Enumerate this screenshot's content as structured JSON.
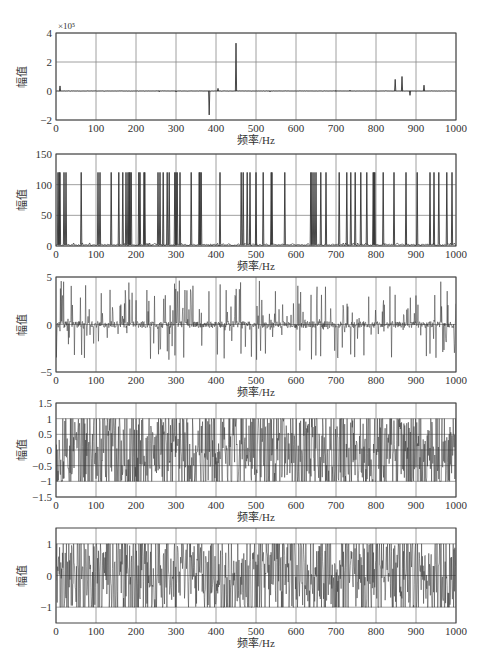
{
  "figure": {
    "width": 490,
    "height": 664,
    "colors": {
      "background": "#ffffff",
      "axes": "#444444",
      "grid": "#888888",
      "line": "#333333",
      "text": "#333333"
    }
  },
  "chart_data": [
    {
      "type": "line",
      "title": "",
      "xlabel": "频率/Hz",
      "ylabel": "幅值",
      "xlim": [
        0,
        1000
      ],
      "ylim": [
        -2,
        4
      ],
      "y_exponent_label": "×10⁵",
      "xticks": [
        0,
        100,
        200,
        300,
        400,
        500,
        600,
        700,
        800,
        900,
        1000
      ],
      "yticks": [
        -2,
        0,
        2,
        4
      ],
      "ytick_labels": [
        "−2",
        "0",
        "2",
        "4"
      ],
      "grid": true,
      "layout": {
        "top": 33,
        "bottom": 120,
        "left": 56,
        "right": 456,
        "show_xlabel": true
      },
      "signal": {
        "mode": "spikes",
        "baseline_noise": 0.02,
        "seed": 11
      },
      "spikes": [
        {
          "x": 10,
          "y": 0.35
        },
        {
          "x": 258,
          "y": -0.05
        },
        {
          "x": 300,
          "y": -0.06
        },
        {
          "x": 383,
          "y": -1.65
        },
        {
          "x": 405,
          "y": 0.18
        },
        {
          "x": 450,
          "y": 3.3
        },
        {
          "x": 535,
          "y": -0.05
        },
        {
          "x": 700,
          "y": 0.04
        },
        {
          "x": 735,
          "y": 0.05
        },
        {
          "x": 848,
          "y": 0.8
        },
        {
          "x": 865,
          "y": 1.0
        },
        {
          "x": 885,
          "y": -0.3
        },
        {
          "x": 920,
          "y": 0.4
        }
      ]
    },
    {
      "type": "line",
      "title": "",
      "xlabel": "频率/Hz",
      "ylabel": "幅值",
      "xlim": [
        0,
        1000
      ],
      "ylim": [
        0,
        150
      ],
      "xticks": [
        0,
        100,
        200,
        300,
        400,
        500,
        600,
        700,
        800,
        900,
        1000
      ],
      "yticks": [
        0,
        50,
        100,
        150
      ],
      "ytick_labels": [
        "0",
        "50",
        "100",
        "150"
      ],
      "grid": true,
      "layout": {
        "top": 154,
        "bottom": 246,
        "left": 56,
        "right": 456,
        "show_xlabel": true
      },
      "signal": {
        "mode": "spikes",
        "baseline": 2,
        "baseline_noise": 3,
        "seed": 23
      },
      "spike_height": 120,
      "spike_positions": [
        5,
        8,
        10,
        20,
        25,
        63,
        105,
        110,
        138,
        157,
        167,
        175,
        180,
        183,
        185,
        188,
        207,
        210,
        220,
        222,
        255,
        260,
        268,
        278,
        283,
        297,
        300,
        303,
        310,
        338,
        358,
        360,
        363,
        410,
        463,
        468,
        478,
        485,
        500,
        518,
        538,
        540,
        572,
        637,
        640,
        645,
        650,
        662,
        675,
        708,
        727,
        737,
        748,
        762,
        777,
        793,
        795,
        797,
        818,
        845,
        875,
        903,
        935,
        945,
        957,
        977,
        990
      ]
    },
    {
      "type": "line",
      "title": "",
      "xlabel": "频率/Hz",
      "ylabel": "幅值",
      "xlim": [
        0,
        1000
      ],
      "ylim": [
        -5,
        5
      ],
      "xticks": [
        0,
        100,
        200,
        300,
        400,
        500,
        600,
        700,
        800,
        900,
        1000
      ],
      "yticks": [
        -5,
        0,
        5
      ],
      "ytick_labels": [
        "−5",
        "0",
        "5"
      ],
      "grid": true,
      "layout": {
        "top": 277,
        "bottom": 372,
        "left": 56,
        "right": 456,
        "show_xlabel": true
      },
      "signal": {
        "mode": "sparse-noise",
        "points": 1000,
        "amplitude": 4.2,
        "density": 0.22,
        "small": 0.35,
        "seed": 37
      }
    },
    {
      "type": "line",
      "title": "",
      "xlabel": "频率/Hz",
      "ylabel": "幅值",
      "xlim": [
        0,
        1000
      ],
      "ylim": [
        -1.5,
        1.5
      ],
      "xticks": [
        0,
        100,
        200,
        300,
        400,
        500,
        600,
        700,
        800,
        900,
        1000
      ],
      "yticks": [
        -1.5,
        -1,
        -0.5,
        0,
        0.5,
        1,
        1.5
      ],
      "ytick_labels": [
        "−1.5",
        "−1",
        "−0.5",
        "0",
        "0.5",
        "1",
        "1.5"
      ],
      "grid": true,
      "layout": {
        "top": 403,
        "bottom": 497,
        "left": 56,
        "right": 456,
        "show_xlabel": true
      },
      "signal": {
        "mode": "clipped-noise",
        "points": 1000,
        "amplitude": 1.4,
        "clip": 1.0,
        "seed": 53
      }
    },
    {
      "type": "line",
      "title": "",
      "xlabel": "频率/Hz",
      "ylabel": "幅值",
      "xlim": [
        0,
        1000
      ],
      "ylim": [
        -1.5,
        1.5
      ],
      "xticks": [
        0,
        100,
        200,
        300,
        400,
        500,
        600,
        700,
        800,
        900,
        1000
      ],
      "yticks": [
        -1,
        0,
        1
      ],
      "ytick_labels": [
        "−1",
        "0",
        "1"
      ],
      "grid": true,
      "layout": {
        "top": 528,
        "bottom": 623,
        "left": 56,
        "right": 456,
        "show_xlabel": true
      },
      "signal": {
        "mode": "clipped-noise",
        "points": 1000,
        "amplitude": 1.3,
        "clip": 1.0,
        "seed": 71
      }
    }
  ]
}
